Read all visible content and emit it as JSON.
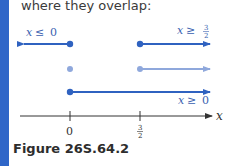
{
  "intro_text": "where they overlap:",
  "caption": "Figure 26S.64.2",
  "colors": {
    "accent_bar": "#2f66c8",
    "ray_dark": "#2f62c0",
    "ray_light": "#8fa8dc",
    "axis": "#333333",
    "label": "#3a5fb0"
  },
  "rows": [
    {
      "name": "x-le-0",
      "label_var": "x",
      "label_op": "≤",
      "label_val": "0"
    },
    {
      "name": "x-ge-3/2",
      "label_var": "x",
      "label_op": "≥",
      "label_num": "3",
      "label_den": "2"
    },
    {
      "name": "overlap",
      "style": "light"
    },
    {
      "name": "x-ge-0",
      "label_var": "x",
      "label_op": "≥",
      "label_val": "0"
    }
  ],
  "axis": {
    "variable": "x",
    "ticks": [
      {
        "value": "0"
      },
      {
        "num": "3",
        "den": "2"
      }
    ]
  }
}
